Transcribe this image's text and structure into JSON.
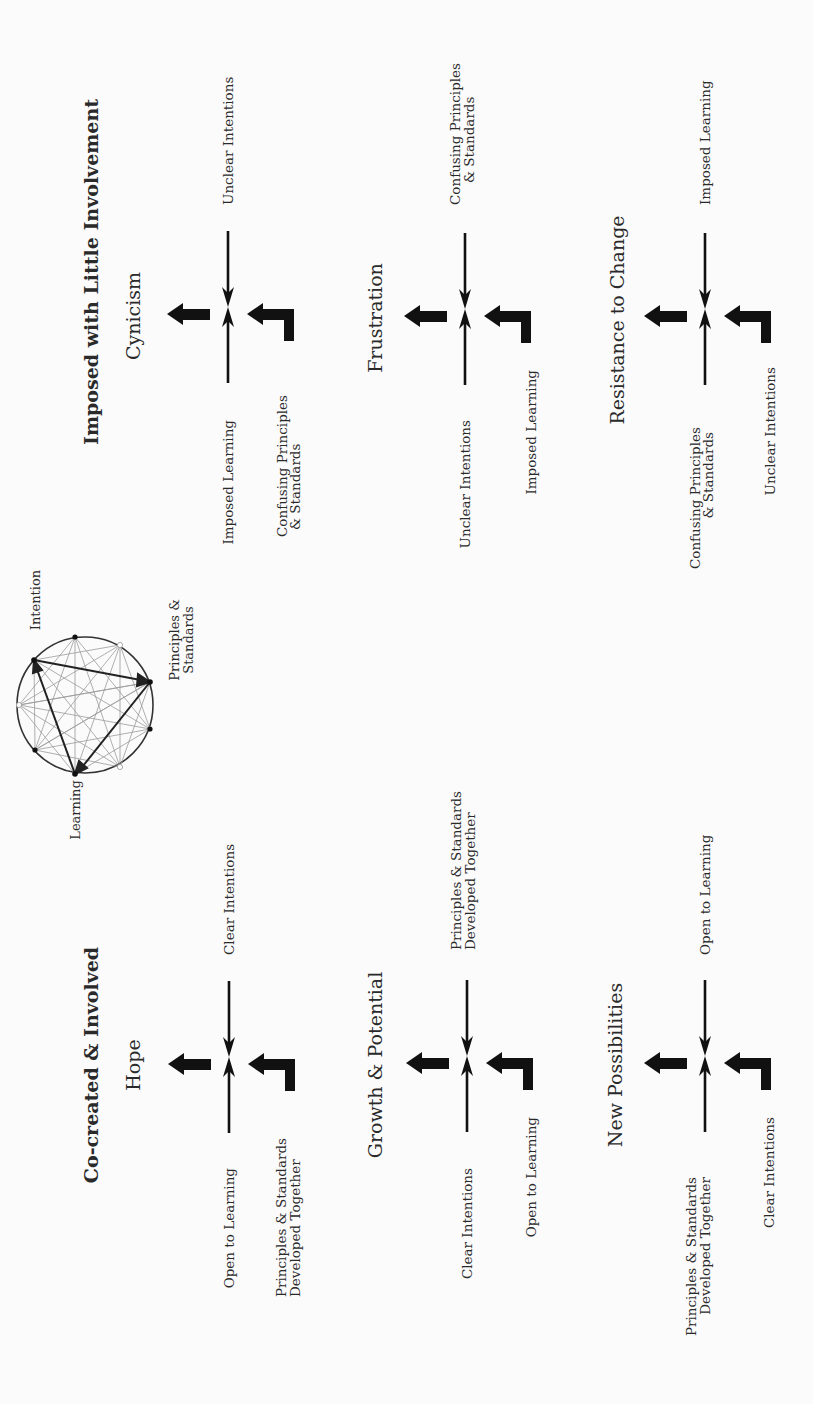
{
  "diagram": {
    "orientation": "rotated -90deg (text reads bottom-to-top)",
    "colors": {
      "background": "#fbfbfb",
      "ink": "#111111",
      "chord": "#9a9a9a",
      "text": "#2a2a2a"
    },
    "center_figure": {
      "labels": {
        "intention": "Intention",
        "principles_1": "Principles &",
        "principles_2": "Standards",
        "learning": "Learning"
      }
    },
    "sections": {
      "imposed": {
        "heading": "Imposed with Little Involvement",
        "blocks": [
          {
            "state": "Cynicism",
            "top": "Unclear Intentions",
            "bottom": "Imposed Learning",
            "corner_1": "Confusing Principles",
            "corner_2": "& Standards",
            "corner_side": "bottom"
          },
          {
            "state": "Frustration",
            "top_1": "Confusing Principles",
            "top_2": "& Standards",
            "bottom": "Unclear Intentions",
            "corner": "Imposed Learning"
          },
          {
            "state": "Resistance to Change",
            "top": "Imposed Learning",
            "bottom_1": "Confusing Principles",
            "bottom_2": "& Standards",
            "corner": "Unclear Intentions"
          }
        ]
      },
      "cocreated": {
        "heading": "Co-created & Involved",
        "blocks": [
          {
            "state": "Hope",
            "top": "Clear Intentions",
            "bottom": "Open to Learning",
            "corner_1": "Principles & Standards",
            "corner_2": "Developed Together"
          },
          {
            "state": "Growth & Potential",
            "top_1": "Principles & Standards",
            "top_2": "Developed Together",
            "bottom": "Clear Intentions",
            "corner": "Open to Learning"
          },
          {
            "state": "New Possibilities",
            "top": "Open to Learning",
            "bottom_1": "Principles & Standards",
            "bottom_2": "Developed Together",
            "corner": "Clear Intentions"
          }
        ]
      }
    }
  }
}
